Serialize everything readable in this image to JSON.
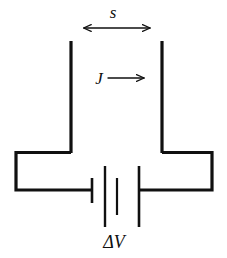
{
  "figure": {
    "kind": "circuit-diagram",
    "width": 227,
    "height": 258,
    "background_color": "#ffffff",
    "line_color": "#101010",
    "text_color": "#101010",
    "thick_stroke_width": 3.2,
    "thin_stroke_width": 1.4
  },
  "labels": {
    "separation": "s",
    "current_density": "J",
    "voltage": "ΔV"
  },
  "label_styles": {
    "separation_font_size": 17,
    "current_density_font_size": 17,
    "voltage_font_size": 18
  },
  "geometry": {
    "left_plate": {
      "x": 71,
      "y_top": 41,
      "y_bottom": 153
    },
    "right_plate": {
      "x": 162,
      "y_top": 41,
      "y_bottom": 153
    },
    "left_loop": {
      "x_left": 16,
      "x_right": 71,
      "y_top": 152,
      "y_bottom": 190
    },
    "right_loop": {
      "x_left": 162,
      "x_right": 212,
      "y_top": 152,
      "y_bottom": 190
    },
    "battery": {
      "y_center": 190,
      "plates": [
        {
          "x": 92,
          "y_top": 178,
          "y_bottom": 203,
          "kind": "short"
        },
        {
          "x": 105,
          "y_top": 166,
          "y_bottom": 227,
          "kind": "long"
        },
        {
          "x": 117,
          "y_top": 178,
          "y_bottom": 215,
          "kind": "short"
        },
        {
          "x": 139,
          "y_top": 166,
          "y_bottom": 227,
          "kind": "long"
        }
      ]
    },
    "separation_arrow": {
      "x_start": 82,
      "x_end": 152,
      "y": 28,
      "heads": "both"
    },
    "current_arrow": {
      "x_start": 108,
      "x_end": 146,
      "y": 78,
      "heads": "end"
    },
    "separation_label_pos": {
      "x": 113,
      "y": 18
    },
    "current_label_pos": {
      "x": 99,
      "y": 84
    },
    "voltage_label_pos": {
      "x": 114,
      "y": 248
    }
  }
}
